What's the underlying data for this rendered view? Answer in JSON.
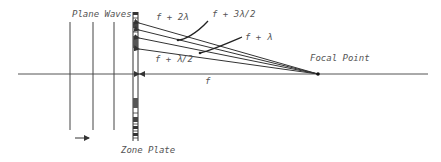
{
  "diagram": {
    "type": "optics-schematic",
    "labels": {
      "plane_waves": "Plane Waves",
      "zone_plate": "Zone Plate",
      "focal_point": "Focal Point",
      "focal_length": "f",
      "ray_f_plus_2lambda": "f + 2λ",
      "ray_f_plus_3half_lambda": "f + 3λ/2",
      "ray_f_plus_lambda": "f + λ",
      "ray_f_plus_half_lambda": "f + λ/2"
    },
    "colors": {
      "line": "#333333",
      "text": "#555555",
      "background": "#ffffff"
    }
  }
}
